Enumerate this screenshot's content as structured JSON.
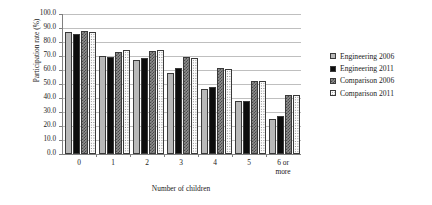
{
  "chart_data": {
    "type": "bar",
    "title": "",
    "xlabel": "Number of children",
    "ylabel": "Participation rate (%)",
    "ylim": [
      0,
      100
    ],
    "ytick_step": 10,
    "ytick_labels": [
      "100.0",
      "90.0",
      "80.0",
      "70.0",
      "60.0",
      "50.0",
      "40.0",
      "30.0",
      "20.0",
      "10.0",
      "0.0"
    ],
    "grid": true,
    "legend_position": "right",
    "categories": [
      "0",
      "1",
      "2",
      "3",
      "4",
      "5",
      "6 or\nmore"
    ],
    "category_labels": [
      {
        "line1": "0",
        "line2": ""
      },
      {
        "line1": "1",
        "line2": ""
      },
      {
        "line1": "2",
        "line2": ""
      },
      {
        "line1": "3",
        "line2": ""
      },
      {
        "line1": "4",
        "line2": ""
      },
      {
        "line1": "5",
        "line2": ""
      },
      {
        "line1": "6 or",
        "line2": "more"
      }
    ],
    "series": [
      {
        "name": "Engineering 2006",
        "fill": "light-gray-solid",
        "color": "#b8b8b8",
        "values": [
          86.8,
          69.7,
          67.3,
          58.1,
          46.5,
          38.2,
          24.7
        ]
      },
      {
        "name": "Engineering 2011",
        "fill": "black-solid",
        "color": "#0d0d0d",
        "values": [
          86.0,
          69.6,
          68.6,
          61.1,
          47.7,
          38.2,
          27.2
        ]
      },
      {
        "name": "Comparison 2006",
        "fill": "dark-checkered",
        "color": "#8f8f8f",
        "values": [
          87.6,
          73.0,
          73.9,
          69.6,
          61.4,
          52.4,
          42.4
        ]
      },
      {
        "name": "Comparison 2011",
        "fill": "white-dotted",
        "color": "#fbfbfb",
        "values": [
          86.8,
          74.0,
          74.0,
          68.8,
          60.7,
          52.1,
          42.0
        ]
      }
    ]
  },
  "legend": {
    "entries": [
      {
        "label": "Engineering 2006"
      },
      {
        "label": "Engineering 2011"
      },
      {
        "label": "Comparison 2006"
      },
      {
        "label": "Comparison 2011"
      }
    ]
  },
  "colors": {
    "axis": "#808080",
    "gridline": "#bfbfbf",
    "bar_outline": "#3a3a3a",
    "text": "#1a1a1a",
    "background": "#ffffff"
  }
}
